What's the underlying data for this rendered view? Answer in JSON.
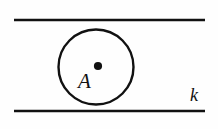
{
  "figure": {
    "kind": "geometry-diagram",
    "background_color": "#fefefe",
    "ink_color": "#111111"
  },
  "labels": {
    "center_point": "A",
    "line": "k"
  },
  "chart_data": {
    "type": "scatter",
    "title": "",
    "xlabel": "",
    "ylabel": "",
    "grid": false,
    "legend": null,
    "xlim": [
      0,
      218
    ],
    "ylim": [
      129,
      0
    ],
    "elements": [
      {
        "name": "top-parallel-line",
        "type": "line",
        "x": [
          14,
          205
        ],
        "y": [
          20,
          20
        ],
        "stroke": "#111111",
        "stroke_width": 2.6,
        "label": ""
      },
      {
        "name": "bottom-parallel-line",
        "type": "line",
        "x": [
          14,
          205
        ],
        "y": [
          111,
          111
        ],
        "stroke": "#111111",
        "stroke_width": 2.6,
        "label": "k"
      },
      {
        "name": "circle",
        "type": "circle",
        "cx": 96,
        "cy": 67,
        "r": 37.5,
        "stroke": "#111111",
        "stroke_width": 2.4,
        "fill": "none"
      },
      {
        "name": "center-point",
        "type": "point",
        "x": 98,
        "y": 66,
        "r": 4.1,
        "fill": "#111111",
        "label": "A"
      }
    ],
    "annotations": [
      {
        "text": "A",
        "x": 86,
        "y": 84,
        "style": "italic-serif",
        "font_size": 21
      },
      {
        "text": "k",
        "x": 196,
        "y": 100,
        "style": "italic-serif",
        "font_size": 18
      }
    ]
  }
}
